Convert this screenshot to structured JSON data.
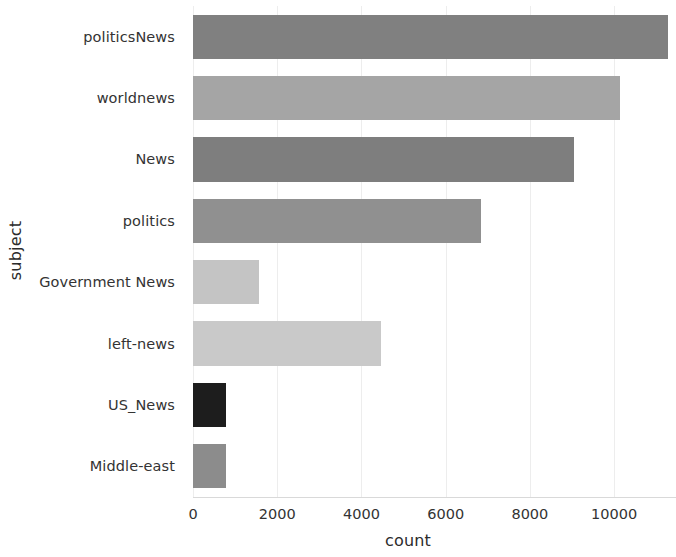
{
  "chart_data": {
    "type": "bar",
    "orientation": "horizontal",
    "title": "",
    "xlabel": "count",
    "ylabel": "subject",
    "categories": [
      "politicsNews",
      "worldnews",
      "News",
      "politics",
      "Government News",
      "left-news",
      "US_News",
      "Middle-east"
    ],
    "values": [
      11272,
      10145,
      9050,
      6841,
      1570,
      4459,
      783,
      778
    ],
    "bar_colors": [
      "#808080",
      "#a5a5a5",
      "#7e7e7e",
      "#909090",
      "#c4c4c4",
      "#c9c9c9",
      "#1d1d1d",
      "#8c8c8c"
    ],
    "xlim": [
      0,
      11470
    ],
    "ylim_categories": 8,
    "xticks": [
      0,
      2000,
      4000,
      6000,
      8000,
      10000
    ],
    "xticklabels": [
      "0",
      "2000",
      "4000",
      "6000",
      "8000",
      "10000"
    ],
    "grid": true,
    "grid_axis": "x",
    "grid_color": "#ededed",
    "legend": null,
    "background": "#ffffff",
    "axis_label_color": "#2b2b2b",
    "tick_label_color": "#333333"
  }
}
